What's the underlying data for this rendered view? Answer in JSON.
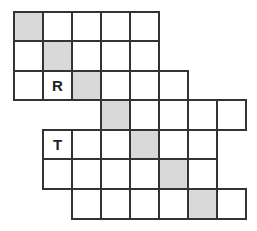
{
  "puzzle": {
    "cell_size": 29,
    "origin": [
      13,
      11
    ],
    "colors": {
      "border": "#333333",
      "shaded": "#d9d9d9",
      "empty": "#ffffff"
    },
    "rows": [
      {
        "start_col": 0,
        "end_col": 4,
        "shaded_col": 0,
        "letters": {}
      },
      {
        "start_col": 0,
        "end_col": 4,
        "shaded_col": 1,
        "letters": {}
      },
      {
        "start_col": 0,
        "end_col": 5,
        "shaded_col": 2,
        "letters": {
          "1": "R"
        }
      },
      {
        "start_col": 3,
        "end_col": 7,
        "shaded_col": 3,
        "letters": {}
      },
      {
        "start_col": 1,
        "end_col": 6,
        "shaded_col": 4,
        "letters": {
          "1": "T"
        }
      },
      {
        "start_col": 1,
        "end_col": 6,
        "shaded_col": 5,
        "letters": {}
      },
      {
        "start_col": 2,
        "end_col": 7,
        "shaded_col": 6,
        "letters": {}
      }
    ]
  }
}
